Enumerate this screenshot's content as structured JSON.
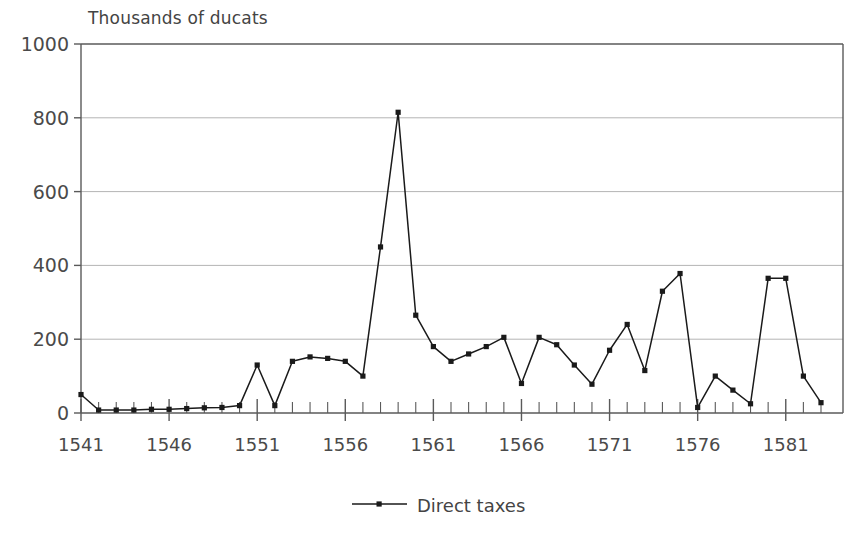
{
  "chart_data": {
    "type": "line",
    "title": "",
    "ylabel": "Thousands of ducats",
    "xlabel": "",
    "ylim": [
      0,
      1000
    ],
    "xlim": [
      1541,
      1583
    ],
    "grid": true,
    "grid_axis": "y",
    "legend_position": "bottom-center",
    "yticks": [
      0,
      200,
      400,
      600,
      800,
      1000
    ],
    "ytick_labels": [
      "0",
      "200",
      "400",
      "600",
      "800",
      "1000"
    ],
    "xticks_major": [
      1541,
      1546,
      1551,
      1556,
      1561,
      1566,
      1571,
      1576,
      1581
    ],
    "xtick_labels": [
      "1541",
      "1546",
      "1551",
      "1556",
      "1561",
      "1566",
      "1571",
      "1576",
      "1581"
    ],
    "xticks_minor_step": 1,
    "series": [
      {
        "name": "Direct taxes",
        "marker": "square",
        "color": "#1a1a1a",
        "x": [
          1541,
          1542,
          1543,
          1544,
          1545,
          1546,
          1547,
          1548,
          1549,
          1550,
          1551,
          1552,
          1553,
          1554,
          1555,
          1556,
          1557,
          1558,
          1559,
          1560,
          1561,
          1562,
          1563,
          1564,
          1565,
          1566,
          1567,
          1568,
          1569,
          1570,
          1571,
          1572,
          1573,
          1574,
          1575,
          1576,
          1577,
          1578,
          1579,
          1580,
          1581,
          1582,
          1583
        ],
        "values": [
          50,
          8,
          8,
          8,
          10,
          10,
          12,
          14,
          15,
          20,
          130,
          20,
          140,
          152,
          148,
          140,
          100,
          450,
          815,
          265,
          180,
          140,
          160,
          180,
          205,
          80,
          205,
          185,
          130,
          78,
          170,
          240,
          115,
          330,
          378,
          15,
          100,
          62,
          25,
          365,
          365,
          100,
          28
        ]
      }
    ]
  },
  "axis_title_text": "Thousands of ducats",
  "legend": {
    "entries": [
      {
        "label": "Direct taxes",
        "marker": "line-with-point"
      }
    ]
  },
  "colors": {
    "line": "#1a1a1a",
    "axis": "#5a5a5a",
    "grid": "#b4b4b4",
    "text": "#4a4a4a",
    "background": "#ffffff"
  }
}
